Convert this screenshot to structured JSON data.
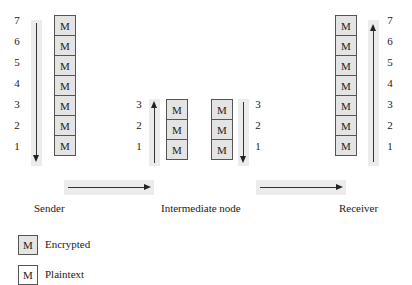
{
  "diagram": {
    "box_label": "M",
    "colors": {
      "encrypted_fill": "#e4e4e4",
      "plaintext_fill": "#ffffff",
      "band": "#ececec",
      "line": "#333333"
    },
    "sender": {
      "label": "Sender",
      "numbers": [
        "7",
        "6",
        "5",
        "4",
        "3",
        "2",
        "1"
      ],
      "arrow_direction": "down",
      "boxes": [
        "M",
        "M",
        "M",
        "M",
        "M",
        "M",
        "M"
      ]
    },
    "intermediate": {
      "label": "Intermediate node",
      "left": {
        "numbers": [
          "3",
          "2",
          "1"
        ],
        "arrow_direction": "up",
        "boxes": [
          "M",
          "M",
          "M"
        ]
      },
      "right": {
        "numbers": [
          "3",
          "2",
          "1"
        ],
        "arrow_direction": "down",
        "boxes": [
          "M",
          "M",
          "M"
        ]
      }
    },
    "receiver": {
      "label": "Receiver",
      "numbers": [
        "7",
        "6",
        "5",
        "4",
        "3",
        "2",
        "1"
      ],
      "arrow_direction": "up",
      "boxes": [
        "M",
        "M",
        "M",
        "M",
        "M",
        "M",
        "M"
      ]
    },
    "flow_arrows": [
      {
        "from": "Sender",
        "to": "Intermediate node",
        "direction": "right"
      },
      {
        "from": "Intermediate node",
        "to": "Receiver",
        "direction": "right"
      }
    ],
    "legend": [
      {
        "box": "M",
        "label": "Encrypted",
        "style": "encrypted"
      },
      {
        "box": "M",
        "label": "Plaintext",
        "style": "plaintext"
      }
    ]
  }
}
